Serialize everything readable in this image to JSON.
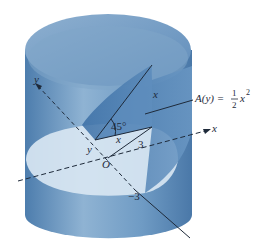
{
  "figure": {
    "labels": {
      "y_axis": "y",
      "x_axis": "x",
      "origin": "O",
      "point_y": "y",
      "angle": "45°",
      "leg_base": "x",
      "leg_height": "x",
      "radius": "3",
      "neg_radius": "−3",
      "area_lhs": "A(y) =",
      "area_frac_num": "1",
      "area_frac_den": "2",
      "area_var": "x",
      "area_exp": "2"
    },
    "colors": {
      "cylinder_dark": "#4f7fae",
      "cylinder_mid": "#7aa3c8",
      "cylinder_light": "#a9c5df",
      "base_ellipse": "#d7e5f1",
      "wedge_face": "#3f73a8",
      "line": "#1e2a3a"
    }
  }
}
